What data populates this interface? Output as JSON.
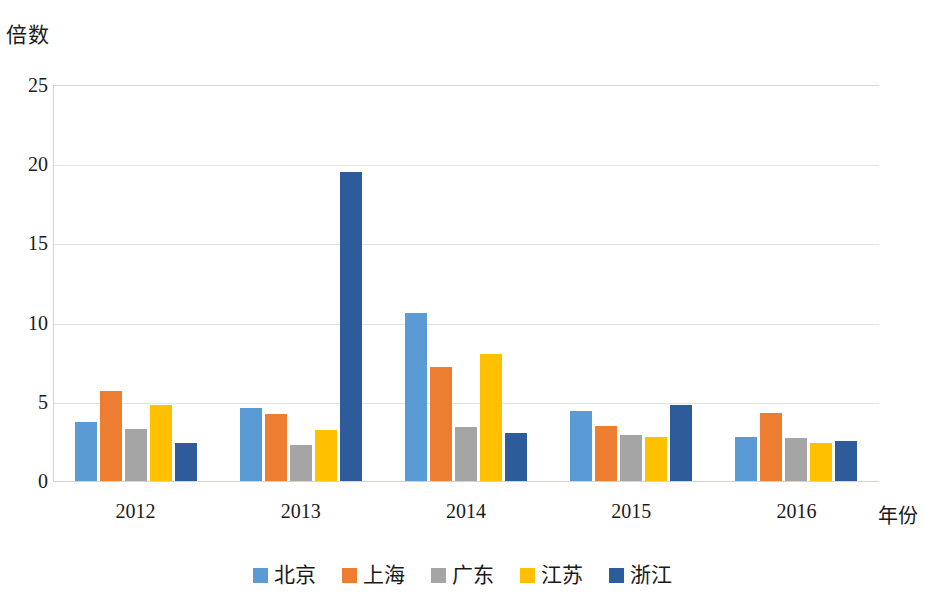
{
  "chart_data": {
    "type": "bar",
    "title": "",
    "subtitle": "",
    "xlabel": "年份",
    "ylabel": "倍数",
    "categories": [
      "2012",
      "2013",
      "2014",
      "2015",
      "2016"
    ],
    "series": [
      {
        "name": "北京",
        "color": "#5B9BD5",
        "values": [
          3.7,
          4.6,
          10.6,
          4.4,
          2.8
        ]
      },
      {
        "name": "上海",
        "color": "#ED7D31",
        "values": [
          5.7,
          4.2,
          7.2,
          3.5,
          4.3
        ]
      },
      {
        "name": "广东",
        "color": "#A5A5A5",
        "values": [
          3.3,
          2.3,
          3.4,
          2.9,
          2.7
        ]
      },
      {
        "name": "江苏",
        "color": "#FFC000",
        "values": [
          4.8,
          3.2,
          8.0,
          2.8,
          2.4
        ]
      },
      {
        "name": "浙江",
        "color": "#2E5C9A",
        "values": [
          2.4,
          19.5,
          3.0,
          4.8,
          2.5
        ]
      }
    ],
    "ylim": [
      0,
      25
    ],
    "yticks": [
      0,
      5,
      10,
      15,
      20,
      25
    ],
    "ytick_labels": [
      "0",
      "5",
      "10",
      "15",
      "20",
      "25"
    ],
    "grid": true,
    "grid_color": "#E8E3D8",
    "legend_position": "bottom",
    "axis_color": "#D9D4C9",
    "background": "#FFFFFF"
  }
}
